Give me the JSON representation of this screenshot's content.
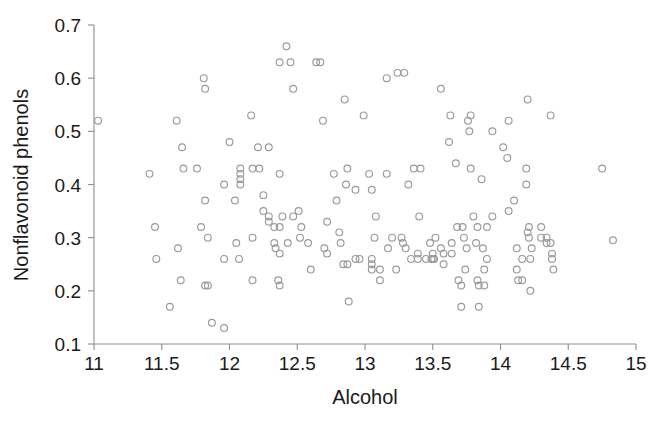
{
  "chart_data": {
    "type": "scatter",
    "title": "",
    "xlabel": "Alcohol",
    "ylabel": "Nonflavonoid phenols",
    "xlim": [
      11,
      15
    ],
    "ylim": [
      0.1,
      0.7
    ],
    "xticks": [
      11,
      11.5,
      12,
      12.5,
      13,
      13.5,
      14,
      14.5,
      15
    ],
    "xtick_labels": [
      "11",
      "11.5",
      "12",
      "12.5",
      "13",
      "13.5",
      "14",
      "14.5",
      "15"
    ],
    "yticks": [
      0.1,
      0.2,
      0.3,
      0.4,
      0.5,
      0.6,
      0.7
    ],
    "ytick_labels": [
      "0.1",
      "0.2",
      "0.3",
      "0.4",
      "0.5",
      "0.6",
      "0.7"
    ],
    "grid": false,
    "legend": null,
    "marker": {
      "shape": "open-circle",
      "radius_px": 3.4,
      "stroke_color": "#9a9a9a",
      "fill": "none"
    },
    "axis_color": "#8d8d8d",
    "background_color": "#ffffff",
    "n_points": 178,
    "points": [
      [
        11.03,
        0.52
      ],
      [
        11.41,
        0.42
      ],
      [
        11.45,
        0.32
      ],
      [
        11.46,
        0.26
      ],
      [
        11.56,
        0.17
      ],
      [
        11.61,
        0.52
      ],
      [
        11.62,
        0.28
      ],
      [
        11.64,
        0.22
      ],
      [
        11.65,
        0.47
      ],
      [
        11.66,
        0.43
      ],
      [
        11.76,
        0.43
      ],
      [
        11.79,
        0.32
      ],
      [
        11.81,
        0.6
      ],
      [
        11.82,
        0.58
      ],
      [
        11.82,
        0.37
      ],
      [
        11.82,
        0.21
      ],
      [
        11.84,
        0.3
      ],
      [
        11.84,
        0.21
      ],
      [
        11.87,
        0.14
      ],
      [
        11.96,
        0.4
      ],
      [
        11.96,
        0.26
      ],
      [
        11.96,
        0.13
      ],
      [
        12.0,
        0.48
      ],
      [
        12.04,
        0.37
      ],
      [
        12.05,
        0.29
      ],
      [
        12.07,
        0.26
      ],
      [
        12.08,
        0.43
      ],
      [
        12.08,
        0.42
      ],
      [
        12.08,
        0.41
      ],
      [
        12.08,
        0.4
      ],
      [
        12.16,
        0.53
      ],
      [
        12.17,
        0.3
      ],
      [
        12.17,
        0.22
      ],
      [
        12.21,
        0.47
      ],
      [
        12.22,
        0.43
      ],
      [
        12.25,
        0.38
      ],
      [
        12.25,
        0.35
      ],
      [
        12.29,
        0.47
      ],
      [
        12.29,
        0.34
      ],
      [
        12.29,
        0.33
      ],
      [
        12.33,
        0.32
      ],
      [
        12.33,
        0.29
      ],
      [
        12.34,
        0.28
      ],
      [
        12.36,
        0.22
      ],
      [
        12.37,
        0.63
      ],
      [
        12.37,
        0.42
      ],
      [
        12.37,
        0.32
      ],
      [
        12.37,
        0.27
      ],
      [
        12.37,
        0.21
      ],
      [
        12.39,
        0.34
      ],
      [
        12.42,
        0.66
      ],
      [
        12.43,
        0.29
      ],
      [
        12.45,
        0.63
      ],
      [
        12.47,
        0.58
      ],
      [
        12.51,
        0.35
      ],
      [
        12.52,
        0.3
      ],
      [
        12.53,
        0.32
      ],
      [
        12.58,
        0.29
      ],
      [
        12.6,
        0.24
      ],
      [
        12.64,
        0.63
      ],
      [
        12.67,
        0.63
      ],
      [
        12.69,
        0.52
      ],
      [
        12.7,
        0.28
      ],
      [
        12.72,
        0.33
      ],
      [
        12.72,
        0.27
      ],
      [
        12.77,
        0.42
      ],
      [
        12.79,
        0.37
      ],
      [
        12.81,
        0.31
      ],
      [
        12.82,
        0.29
      ],
      [
        12.84,
        0.25
      ],
      [
        12.85,
        0.56
      ],
      [
        12.86,
        0.4
      ],
      [
        12.87,
        0.25
      ],
      [
        12.88,
        0.18
      ],
      [
        12.93,
        0.39
      ],
      [
        12.93,
        0.26
      ],
      [
        12.96,
        0.26
      ],
      [
        12.99,
        0.53
      ],
      [
        13.03,
        0.42
      ],
      [
        13.05,
        0.26
      ],
      [
        13.05,
        0.25
      ],
      [
        13.05,
        0.24
      ],
      [
        13.07,
        0.3
      ],
      [
        13.08,
        0.34
      ],
      [
        13.11,
        0.24
      ],
      [
        13.11,
        0.22
      ],
      [
        13.16,
        0.6
      ],
      [
        13.16,
        0.42
      ],
      [
        13.17,
        0.28
      ],
      [
        13.2,
        0.3
      ],
      [
        13.23,
        0.24
      ],
      [
        13.24,
        0.61
      ],
      [
        13.27,
        0.3
      ],
      [
        13.28,
        0.29
      ],
      [
        13.29,
        0.61
      ],
      [
        13.3,
        0.28
      ],
      [
        13.32,
        0.4
      ],
      [
        13.34,
        0.26
      ],
      [
        13.36,
        0.43
      ],
      [
        13.39,
        0.27
      ],
      [
        13.39,
        0.26
      ],
      [
        13.4,
        0.34
      ],
      [
        13.41,
        0.43
      ],
      [
        13.45,
        0.26
      ],
      [
        13.48,
        0.29
      ],
      [
        13.49,
        0.26
      ],
      [
        13.5,
        0.27
      ],
      [
        13.5,
        0.26
      ],
      [
        13.51,
        0.26
      ],
      [
        13.52,
        0.3
      ],
      [
        13.56,
        0.58
      ],
      [
        13.56,
        0.28
      ],
      [
        13.58,
        0.27
      ],
      [
        13.58,
        0.25
      ],
      [
        13.62,
        0.48
      ],
      [
        13.63,
        0.53
      ],
      [
        13.64,
        0.29
      ],
      [
        13.64,
        0.27
      ],
      [
        13.67,
        0.44
      ],
      [
        13.68,
        0.32
      ],
      [
        13.69,
        0.22
      ],
      [
        13.71,
        0.21
      ],
      [
        13.71,
        0.17
      ],
      [
        13.72,
        0.32
      ],
      [
        13.73,
        0.3
      ],
      [
        13.74,
        0.24
      ],
      [
        13.75,
        0.28
      ],
      [
        13.76,
        0.52
      ],
      [
        13.77,
        0.5
      ],
      [
        13.78,
        0.53
      ],
      [
        13.78,
        0.43
      ],
      [
        13.8,
        0.34
      ],
      [
        13.82,
        0.29
      ],
      [
        13.83,
        0.32
      ],
      [
        13.83,
        0.22
      ],
      [
        13.84,
        0.21
      ],
      [
        13.84,
        0.17
      ],
      [
        13.86,
        0.41
      ],
      [
        13.87,
        0.28
      ],
      [
        13.88,
        0.24
      ],
      [
        13.88,
        0.21
      ],
      [
        13.9,
        0.32
      ],
      [
        13.9,
        0.26
      ],
      [
        13.94,
        0.5
      ],
      [
        13.94,
        0.34
      ],
      [
        14.02,
        0.47
      ],
      [
        14.05,
        0.45
      ],
      [
        14.06,
        0.52
      ],
      [
        14.06,
        0.35
      ],
      [
        14.1,
        0.37
      ],
      [
        14.12,
        0.28
      ],
      [
        14.12,
        0.24
      ],
      [
        14.13,
        0.22
      ],
      [
        14.16,
        0.26
      ],
      [
        14.16,
        0.22
      ],
      [
        14.19,
        0.43
      ],
      [
        14.19,
        0.4
      ],
      [
        14.2,
        0.56
      ],
      [
        14.2,
        0.31
      ],
      [
        14.21,
        0.32
      ],
      [
        14.21,
        0.3
      ],
      [
        14.22,
        0.26
      ],
      [
        14.22,
        0.2
      ],
      [
        14.23,
        0.28
      ],
      [
        14.3,
        0.32
      ],
      [
        14.3,
        0.3
      ],
      [
        14.34,
        0.3
      ],
      [
        14.34,
        0.29
      ],
      [
        14.37,
        0.53
      ],
      [
        14.37,
        0.29
      ],
      [
        14.38,
        0.27
      ],
      [
        14.38,
        0.26
      ],
      [
        14.39,
        0.24
      ],
      [
        14.75,
        0.43
      ],
      [
        14.83,
        0.295
      ],
      [
        12.47,
        0.34
      ],
      [
        12.17,
        0.43
      ],
      [
        13.05,
        0.39
      ],
      [
        12.87,
        0.43
      ]
    ]
  },
  "axes": {
    "x_axis_name": "alcohol-axis",
    "y_axis_name": "nonflavonoid-phenols-axis"
  }
}
